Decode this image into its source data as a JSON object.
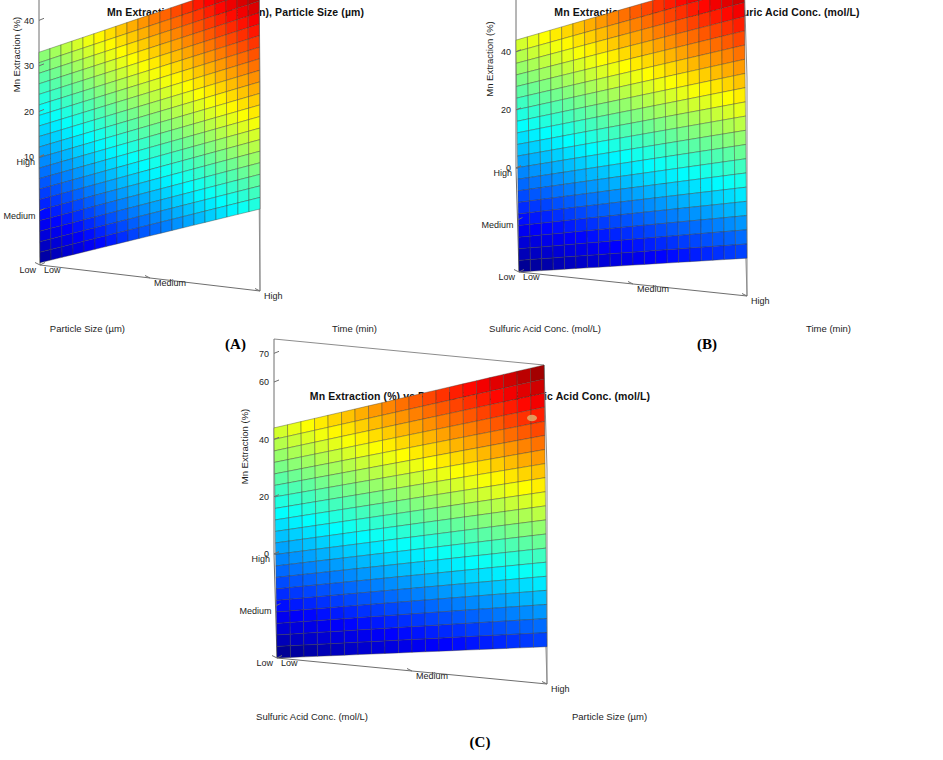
{
  "figure": {
    "background": "#ffffff",
    "colormap": "jet",
    "colormap_stops": [
      "#00007F",
      "#0000C8",
      "#0000FF",
      "#0040FF",
      "#0080FF",
      "#00BFFF",
      "#00FFFF",
      "#40FFBF",
      "#80FF80",
      "#BFFF40",
      "#FFFF00",
      "#FFBF00",
      "#FF8000",
      "#FF4000",
      "#FF0000",
      "#C80000",
      "#7F0000"
    ]
  },
  "panels": [
    {
      "key": "A",
      "letter": "(A)",
      "title": "Mn Extraction (%) vs Time (min), Particle Size (µm)",
      "z_label": "Mn Extraction (%)",
      "z_ticks": [
        "10",
        "20",
        "30",
        "40",
        "50"
      ],
      "left_axis_name": "Particle Size (µm)",
      "left_axis_ticks": [
        "High",
        "Medium",
        "Low"
      ],
      "right_axis_name": "Time (min)",
      "right_axis_ticks": [
        "Low",
        "Medium",
        "High"
      ]
    },
    {
      "key": "B",
      "letter": "(B)",
      "title": "Mn Extraction (%) vs Time (min), Sulfuric Acid Conc. (mol/L)",
      "z_label": "Mn Extraction (%)",
      "z_ticks": [
        "0",
        "20",
        "40",
        "60",
        "70"
      ],
      "left_axis_name": "Sulfuric Acid Conc. (mol/L)",
      "left_axis_ticks": [
        "High",
        "Medium",
        "Low"
      ],
      "right_axis_name": "Time (min)",
      "right_axis_ticks": [
        "Low",
        "Medium",
        "High"
      ]
    },
    {
      "key": "C",
      "letter": "(C)",
      "title": "Mn Extraction (%) vs Particle Size (µm), Sulfuric Acid Conc. (mol/L)",
      "z_label": "Mn Extraction (%)",
      "z_ticks": [
        "0",
        "20",
        "40",
        "60",
        "70"
      ],
      "left_axis_name": "Sulfuric Acid Conc. (mol/L)",
      "left_axis_ticks": [
        "High",
        "Medium",
        "Low"
      ],
      "right_axis_name": "Particle Size (µm)",
      "right_axis_ticks": [
        "Low",
        "Medium",
        "High"
      ]
    }
  ],
  "chart_data": [
    {
      "type": "surface",
      "panel": "A",
      "title": "Mn Extraction (%) vs Time (min), Particle Size (µm)",
      "xlabel": "Time (min)",
      "ylabel": "Particle Size (µm)",
      "zlabel": "Mn Extraction (%)",
      "x_tick_labels": [
        "Low",
        "Medium",
        "High"
      ],
      "y_tick_labels": [
        "Low",
        "Medium",
        "High"
      ],
      "zlim": [
        10,
        55
      ],
      "z_ticks": [
        10,
        20,
        30,
        40,
        50
      ],
      "grid": true,
      "legend": "none",
      "corner_values": {
        "x_low_y_low": 10.5,
        "x_high_y_low": 28.0,
        "x_low_y_high": 33.0,
        "x_high_y_high": 55.0
      },
      "comment": "Planar response surface rising with Time and with Particle Size axis toward High."
    },
    {
      "type": "surface",
      "panel": "B",
      "title": "Mn Extraction (%) vs Time (min), Sulfuric Acid Conc. (mol/L)",
      "xlabel": "Time (min)",
      "ylabel": "Sulfuric Acid Conc. (mol/L)",
      "zlabel": "Mn Extraction (%)",
      "x_tick_labels": [
        "Low",
        "Medium",
        "High"
      ],
      "y_tick_labels": [
        "Low",
        "Medium",
        "High"
      ],
      "zlim": [
        0,
        75
      ],
      "z_ticks": [
        0,
        20,
        40,
        60,
        70
      ],
      "grid": true,
      "legend": "none",
      "corner_values": {
        "x_low_y_low": 0.0,
        "x_high_y_low": 13.0,
        "x_low_y_high": 44.0,
        "x_high_y_high": 75.0
      },
      "comment": "Planar response surface rising strongly with acid concentration."
    },
    {
      "type": "surface",
      "panel": "C",
      "title": "Mn Extraction (%) vs Particle Size (µm), Sulfuric Acid Conc. (mol/L)",
      "xlabel": "Particle Size (µm)",
      "ylabel": "Sulfuric Acid Conc. (mol/L)",
      "zlabel": "Mn Extraction (%)",
      "x_tick_labels": [
        "Low",
        "Medium",
        "High"
      ],
      "y_tick_labels": [
        "Low",
        "Medium",
        "High"
      ],
      "zlim": [
        0,
        75
      ],
      "z_ticks": [
        0,
        20,
        40,
        60,
        70
      ],
      "grid": true,
      "legend": "none",
      "corner_values": {
        "x_low_y_low": 0.0,
        "x_high_y_low": 13.0,
        "x_low_y_high": 44.0,
        "x_high_y_high": 75.0
      },
      "comment": "Planar response surface rising with acid concentration and particle-size axis."
    }
  ]
}
